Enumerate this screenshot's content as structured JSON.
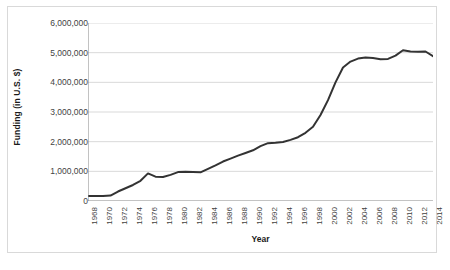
{
  "chart_data": {
    "type": "line",
    "title": "",
    "xlabel": "Year",
    "ylabel": "Funding (in U.S. $)",
    "xlim": [
      1968,
      2014
    ],
    "ylim": [
      0,
      6000000
    ],
    "grid": true,
    "legend": "none",
    "line_color": "#333333",
    "gridline_color": "#d9d9d9",
    "axis_color": "#868686",
    "y_ticks": [
      0,
      1000000,
      2000000,
      3000000,
      4000000,
      5000000,
      6000000
    ],
    "y_tick_labels": [
      "0",
      "1,000,000",
      "2,000,000",
      "3,000,000",
      "4,000,000",
      "5,000,000",
      "6,000,000"
    ],
    "x_tick_labels": [
      "1968",
      "1970",
      "1972",
      "1974",
      "1976",
      "1978",
      "1980",
      "1982",
      "1984",
      "1986",
      "1988",
      "1990",
      "1992",
      "1994",
      "1996",
      "1998",
      "2000",
      "2002",
      "2004",
      "2006",
      "2008",
      "2010",
      "2012",
      "2014"
    ],
    "x_tick_interval": 2,
    "x": [
      1968,
      1969,
      1970,
      1971,
      1972,
      1973,
      1974,
      1975,
      1976,
      1977,
      1978,
      1979,
      1980,
      1981,
      1982,
      1983,
      1984,
      1985,
      1986,
      1987,
      1988,
      1989,
      1990,
      1991,
      1992,
      1993,
      1994,
      1995,
      1996,
      1997,
      1998,
      1999,
      2000,
      2001,
      2002,
      2003,
      2004,
      2005,
      2006,
      2007,
      2008,
      2009,
      2010,
      2011,
      2012,
      2013,
      2014
    ],
    "series": [
      {
        "name": "Funding",
        "values": [
          165000,
          168000,
          170000,
          185000,
          320000,
          430000,
          540000,
          680000,
          930000,
          820000,
          810000,
          880000,
          975000,
          985000,
          975000,
          965000,
          1080000,
          1200000,
          1330000,
          1430000,
          1530000,
          1620000,
          1710000,
          1850000,
          1950000,
          1965000,
          1990000,
          2060000,
          2150000,
          2300000,
          2500000,
          2900000,
          3400000,
          4000000,
          4500000,
          4700000,
          4800000,
          4840000,
          4820000,
          4780000,
          4790000,
          4900000,
          5080000,
          5040000,
          5030000,
          5040000,
          4880000
        ]
      }
    ]
  }
}
